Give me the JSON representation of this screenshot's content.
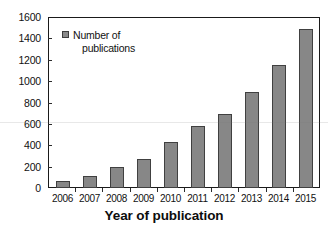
{
  "chart_data": {
    "type": "bar",
    "title": "",
    "subtitle": "",
    "categories": [
      "2006",
      "2007",
      "2008",
      "2009",
      "2010",
      "2011",
      "2012",
      "2013",
      "2014",
      "2015"
    ],
    "values": [
      70,
      110,
      200,
      270,
      430,
      580,
      700,
      900,
      1160,
      1500
    ],
    "series": [
      {
        "name": "Number of publications",
        "values": [
          70,
          110,
          200,
          270,
          430,
          580,
          700,
          900,
          1160,
          1500
        ]
      }
    ],
    "xlabel": "Year of publication",
    "ylabel": "",
    "ylim": [
      0,
      1600
    ],
    "ytick_labels": [
      "0",
      "200",
      "400",
      "600",
      "800",
      "1000",
      "1200",
      "1400",
      "1600"
    ],
    "ytick_values": [
      0,
      200,
      400,
      600,
      800,
      1000,
      1200,
      1400,
      1600
    ],
    "grid": false,
    "legend_position": "inside-top-left",
    "legend": [
      {
        "label_line1": "Number of",
        "label_line2": "publications",
        "color": "#878787"
      }
    ],
    "bar_color": "#878787",
    "bar_border_color": "#404040",
    "axis_color": "#1a1a1a",
    "background": "#ffffff"
  }
}
